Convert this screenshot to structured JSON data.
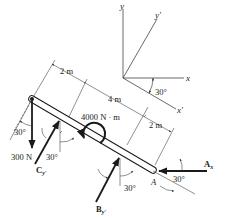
{
  "figure": {
    "type": "free-body-diagram",
    "colors": {
      "ink": "#1a1a1a",
      "thin": "#444444",
      "beam_fill": "#ffffff"
    }
  },
  "axes": {
    "y_label": "y",
    "x_label": "x",
    "y_prime_label": "y'",
    "x_prime_label": "x'",
    "angle_label": "30°"
  },
  "dimensions": {
    "left_segment": "2 m",
    "middle_segment": "4 m",
    "right_segment": "2 m"
  },
  "loads": {
    "moment": "4000 N · m",
    "force_300": "300 N",
    "angle_300": "30°"
  },
  "reactions": {
    "C": {
      "label_main": "C",
      "label_sub": "y'",
      "angle": "30°"
    },
    "B": {
      "label_main": "B",
      "label_sub": "y'",
      "angle": "30°"
    },
    "A": {
      "point_label": "A",
      "force_main": "A",
      "force_sub": "x",
      "angle": "30°"
    }
  }
}
